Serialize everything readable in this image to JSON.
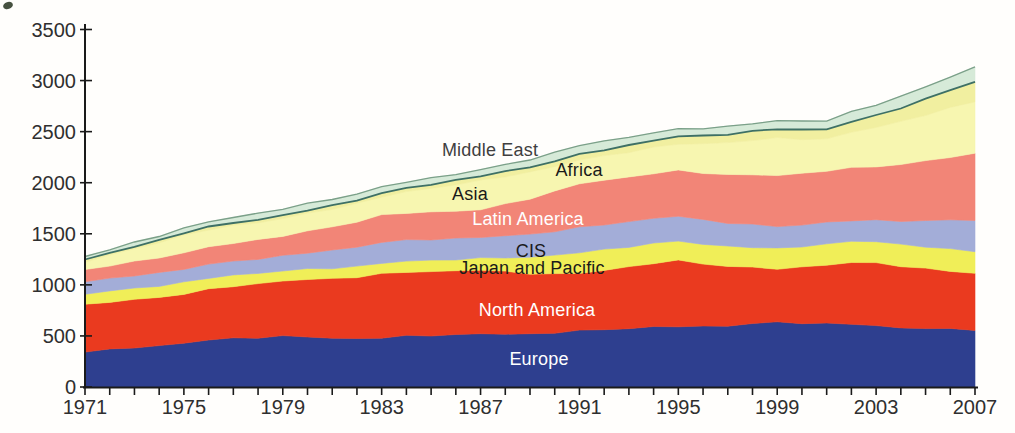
{
  "chart_data": {
    "type": "area",
    "stacked": true,
    "title": "",
    "xlabel": "",
    "ylabel": "",
    "xlim": [
      1971,
      2007
    ],
    "ylim": [
      0,
      3500
    ],
    "grid": false,
    "legend_position": "labels-on-areas",
    "y_ticks": [
      0,
      500,
      1000,
      1500,
      2000,
      2500,
      3000,
      3500
    ],
    "x_tick_label_years": [
      1971,
      1975,
      1979,
      1983,
      1987,
      1991,
      1995,
      1999,
      2003,
      2007
    ],
    "x_minor_tick_step_years": 1,
    "x": [
      1971,
      1975,
      1979,
      1983,
      1987,
      1991,
      1995,
      1999,
      2001,
      2003,
      2005,
      2007
    ],
    "series": [
      {
        "name": "Europe",
        "color": "#2e3f8f",
        "label_color": "#ffffff",
        "values": [
          355,
          430,
          500,
          480,
          515,
          550,
          585,
          640,
          615,
          590,
          580,
          570
        ]
      },
      {
        "name": "North America",
        "color": "#ea3a1f",
        "label_color": "#ffffff",
        "values": [
          460,
          480,
          540,
          625,
          625,
          560,
          645,
          520,
          575,
          620,
          585,
          550
        ]
      },
      {
        "name": "Japan and Pacific",
        "color": "#f0ee58",
        "label_color": "#1a1a1a",
        "values": [
          105,
          115,
          100,
          105,
          115,
          205,
          190,
          200,
          205,
          210,
          215,
          215
        ]
      },
      {
        "name": "CIS",
        "color": "#a3add8",
        "label_color": "#1a1a1a",
        "values": [
          120,
          130,
          145,
          205,
          205,
          245,
          245,
          215,
          210,
          205,
          255,
          310
        ]
      },
      {
        "name": "Latin America",
        "color": "#f28577",
        "label_color": "#ffffff",
        "values": [
          115,
          160,
          195,
          265,
          270,
          430,
          445,
          500,
          505,
          525,
          585,
          650
        ]
      },
      {
        "name": "Asia",
        "color": "#f7f6b0",
        "label_color": "#1a1a1a",
        "values": [
          80,
          170,
          170,
          180,
          285,
          230,
          260,
          365,
          310,
          385,
          450,
          510
        ]
      },
      {
        "name": "Africa",
        "color": "#f1efa0",
        "label_color": "#1a1a1a",
        "values": [
          20,
          25,
          30,
          35,
          45,
          55,
          75,
          90,
          95,
          115,
          155,
          195
        ]
      },
      {
        "name": "Middle East",
        "color": "#d6ead8",
        "label_color": "#3f3f3f",
        "values": [
          30,
          45,
          65,
          60,
          60,
          90,
          70,
          80,
          85,
          105,
          120,
          140
        ]
      }
    ],
    "totals_reference": {
      "1971": 1285,
      "1979": 1745,
      "1987": 2120,
      "1995": 2515,
      "2007": 3140
    },
    "axis_color": "#1a1a1a",
    "tick_label_color": "#2f2f2f",
    "middle_east_bottom_stroke": "#3e7065",
    "top_edge_stroke": "#7ba089"
  }
}
